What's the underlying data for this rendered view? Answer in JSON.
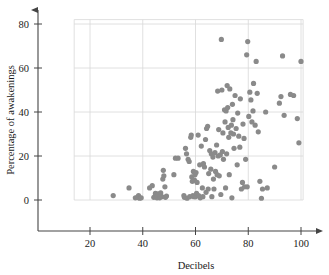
{
  "chart_data": {
    "type": "scatter",
    "title": "",
    "xlabel": "Decibels",
    "ylabel": "Percentage of awakenings",
    "xlim": [
      15,
      105
    ],
    "ylim": [
      -9,
      84
    ],
    "xticks": [
      20,
      40,
      60,
      80,
      100
    ],
    "yticks": [
      0,
      20,
      40,
      60,
      80
    ],
    "xtick_labels": [
      "20",
      "40",
      "60",
      "80",
      "100"
    ],
    "ytick_labels": [
      "0",
      "20",
      "40",
      "60",
      "80"
    ],
    "grid": true,
    "grid_color": "#d8d8d8",
    "axis_color": "#444444",
    "marker_color": "#8a8a8a",
    "marker_size": 2.6,
    "legend": null,
    "n_points": 140,
    "points": [
      [
        28.8,
        2.0
      ],
      [
        34.8,
        5.5
      ],
      [
        37.2,
        1.0
      ],
      [
        38.0,
        1.2
      ],
      [
        38.4,
        2.0
      ],
      [
        38.8,
        0.8
      ],
      [
        39.4,
        1.0
      ],
      [
        42.6,
        5.5
      ],
      [
        43.6,
        6.5
      ],
      [
        44.2,
        1.2
      ],
      [
        44.8,
        3.0
      ],
      [
        45.4,
        1.0
      ],
      [
        45.8,
        2.8
      ],
      [
        46.4,
        1.0
      ],
      [
        46.8,
        3.2
      ],
      [
        47.2,
        1.5
      ],
      [
        47.6,
        9.5
      ],
      [
        47.8,
        13.5
      ],
      [
        48.0,
        11.0
      ],
      [
        48.4,
        6.0
      ],
      [
        48.6,
        1.2
      ],
      [
        49.0,
        1.8
      ],
      [
        51.8,
        11.5
      ],
      [
        52.4,
        19.0
      ],
      [
        53.4,
        19.0
      ],
      [
        55.6,
        2.0
      ],
      [
        55.8,
        1.2
      ],
      [
        56.2,
        23.5
      ],
      [
        56.6,
        21.0
      ],
      [
        56.8,
        0.8
      ],
      [
        57.2,
        18.5
      ],
      [
        57.6,
        17.5
      ],
      [
        57.8,
        1.5
      ],
      [
        58.2,
        28.5
      ],
      [
        58.4,
        29.5
      ],
      [
        58.6,
        10.5
      ],
      [
        58.8,
        8.5
      ],
      [
        59.0,
        2.0
      ],
      [
        59.2,
        13.0
      ],
      [
        59.4,
        1.5
      ],
      [
        59.6,
        9.0
      ],
      [
        59.8,
        11.5
      ],
      [
        60.0,
        1.5
      ],
      [
        60.2,
        12.5
      ],
      [
        60.4,
        3.0
      ],
      [
        60.6,
        8.0
      ],
      [
        61.0,
        29.5
      ],
      [
        61.2,
        2.0
      ],
      [
        61.6,
        16.0
      ],
      [
        61.8,
        1.0
      ],
      [
        62.2,
        24.5
      ],
      [
        62.6,
        5.5
      ],
      [
        62.8,
        1.5
      ],
      [
        63.0,
        16.5
      ],
      [
        63.4,
        15.0
      ],
      [
        63.8,
        27.5
      ],
      [
        64.0,
        3.5
      ],
      [
        64.2,
        32.5
      ],
      [
        64.6,
        33.5
      ],
      [
        64.8,
        5.0
      ],
      [
        65.0,
        12.0
      ],
      [
        65.4,
        22.5
      ],
      [
        65.8,
        14.0
      ],
      [
        66.0,
        21.0
      ],
      [
        66.2,
        1.5
      ],
      [
        66.6,
        19.5
      ],
      [
        66.8,
        9.5
      ],
      [
        67.0,
        5.0
      ],
      [
        67.4,
        21.5
      ],
      [
        67.6,
        13.0
      ],
      [
        68.0,
        25.0
      ],
      [
        68.2,
        11.5
      ],
      [
        68.4,
        49.5
      ],
      [
        68.6,
        20.0
      ],
      [
        68.8,
        32.0
      ],
      [
        69.0,
        11.0
      ],
      [
        69.4,
        20.5
      ],
      [
        69.6,
        2.5
      ],
      [
        69.8,
        73.0
      ],
      [
        70.0,
        50.0
      ],
      [
        70.2,
        22.0
      ],
      [
        70.4,
        30.5
      ],
      [
        70.6,
        18.5
      ],
      [
        71.0,
        41.0
      ],
      [
        71.2,
        35.5
      ],
      [
        71.4,
        5.5
      ],
      [
        71.6,
        40.5
      ],
      [
        71.8,
        21.0
      ],
      [
        72.0,
        52.0
      ],
      [
        72.2,
        42.0
      ],
      [
        72.4,
        33.0
      ],
      [
        72.6,
        28.5
      ],
      [
        72.8,
        11.5
      ],
      [
        73.0,
        50.5
      ],
      [
        73.4,
        30.5
      ],
      [
        73.6,
        34.0
      ],
      [
        73.8,
        1.0
      ],
      [
        74.0,
        43.5
      ],
      [
        74.2,
        36.5
      ],
      [
        74.4,
        30.0
      ],
      [
        74.6,
        23.5
      ],
      [
        75.0,
        47.5
      ],
      [
        75.4,
        32.5
      ],
      [
        75.8,
        16.0
      ],
      [
        76.0,
        39.5
      ],
      [
        76.4,
        29.0
      ],
      [
        76.8,
        24.0
      ],
      [
        77.0,
        46.0
      ],
      [
        77.4,
        5.0
      ],
      [
        77.8,
        8.0
      ],
      [
        78.0,
        34.5
      ],
      [
        78.4,
        28.0
      ],
      [
        78.6,
        6.0
      ],
      [
        79.0,
        18.5
      ],
      [
        79.4,
        66.0
      ],
      [
        79.6,
        6.0
      ],
      [
        79.8,
        72.0
      ],
      [
        80.2,
        38.0
      ],
      [
        80.6,
        49.0
      ],
      [
        81.0,
        45.5
      ],
      [
        81.4,
        35.5
      ],
      [
        81.8,
        40.5
      ],
      [
        82.0,
        53.0
      ],
      [
        82.6,
        34.0
      ],
      [
        83.0,
        63.0
      ],
      [
        83.4,
        48.5
      ],
      [
        83.8,
        31.0
      ],
      [
        84.4,
        8.5
      ],
      [
        85.0,
        0.8
      ],
      [
        85.4,
        5.0
      ],
      [
        86.6,
        40.0
      ],
      [
        87.2,
        5.5
      ],
      [
        90.0,
        15.0
      ],
      [
        91.8,
        44.0
      ],
      [
        92.4,
        47.0
      ],
      [
        93.0,
        65.5
      ],
      [
        93.6,
        38.5
      ],
      [
        96.0,
        48.0
      ],
      [
        97.2,
        47.5
      ],
      [
        98.6,
        37.0
      ],
      [
        99.2,
        26.0
      ],
      [
        100.0,
        63.0
      ]
    ]
  }
}
